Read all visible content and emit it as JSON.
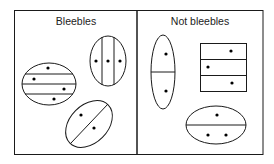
{
  "panels": {
    "left": {
      "title": "Bleebles"
    },
    "right": {
      "title": "Not bleebles"
    }
  },
  "figures": {
    "left": [
      {
        "shape": "ellipse",
        "divisions": "3 horizontal lines (4 regions)",
        "dots": 4
      },
      {
        "shape": "ellipse",
        "divisions": "2 vertical lines (3 regions)",
        "dots": 3
      },
      {
        "shape": "ellipse",
        "divisions": "1 diagonal line (2 regions)",
        "dots": 2
      }
    ],
    "right": [
      {
        "shape": "ellipse",
        "divisions": "1 horizontal line (2 regions)",
        "dots": 2
      },
      {
        "shape": "rectangle",
        "divisions": "2 horizontal lines (3 regions)",
        "dots": 3
      },
      {
        "shape": "ellipse",
        "divisions": "1 horizontal line (2 regions)",
        "dots": 3
      }
    ]
  },
  "colors": {
    "stroke": "#1a1a1a",
    "background": "#ffffff"
  }
}
